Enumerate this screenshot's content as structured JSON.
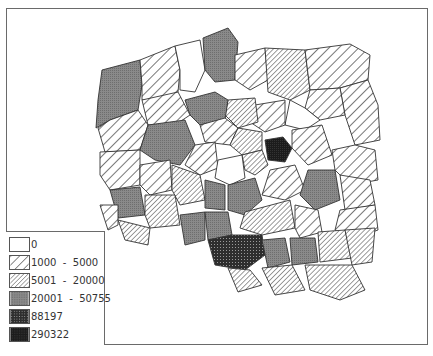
{
  "map": {
    "subject": "Poland voivodeships choropleth",
    "regions_count_visible": 49
  },
  "legend": {
    "items": [
      {
        "label": "0",
        "pattern": "white",
        "color": "#ffffff"
      },
      {
        "label": "1000  -  5000",
        "pattern": "wide-diagonal-hatch",
        "color": "#555555"
      },
      {
        "label": "5001  -  20000",
        "pattern": "dense-diagonal-hatch",
        "color": "#666666"
      },
      {
        "label": "20001  -  50755",
        "pattern": "gray-stipple",
        "color": "#7a7a7a"
      },
      {
        "label": "88197",
        "pattern": "dark-checker",
        "color": "#3a3a3a"
      },
      {
        "label": "290322",
        "pattern": "near-black",
        "color": "#1c1c1c"
      }
    ]
  }
}
